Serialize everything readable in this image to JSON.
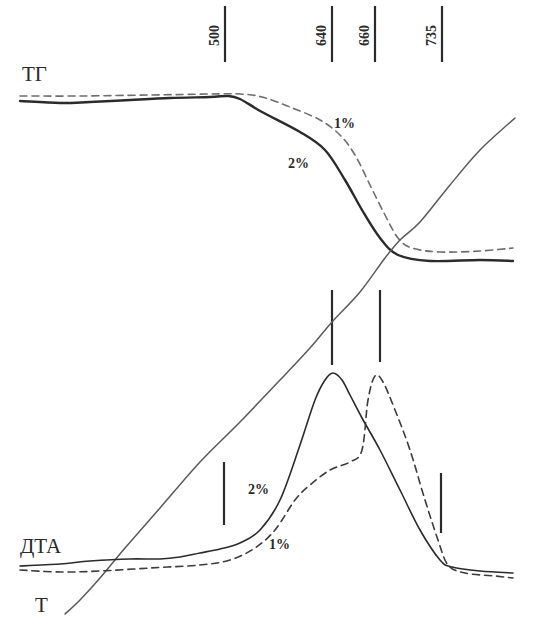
{
  "chart_data": {
    "type": "line",
    "title": "",
    "xlabel": "",
    "ylabel": "",
    "grid": false,
    "legend": "inline annotations",
    "curve_labels": {
      "tg": "ТГ",
      "dta": "ДТА",
      "t": "Т"
    },
    "temperature_markers": [
      {
        "label": "500",
        "x": 225
      },
      {
        "label": "640",
        "x": 332
      },
      {
        "label": "660",
        "x": 375
      },
      {
        "label": "735",
        "x": 442
      }
    ],
    "series": [
      {
        "name": "ТГ 2%",
        "group": "TG",
        "style": "solid",
        "color": "#2b2b2b",
        "width": 2.4,
        "points": [
          [
            20,
            101
          ],
          [
            60,
            103
          ],
          [
            90,
            102
          ],
          [
            130,
            100
          ],
          [
            170,
            98
          ],
          [
            210,
            97
          ],
          [
            228,
            96
          ],
          [
            240,
            99
          ],
          [
            262,
            112
          ],
          [
            300,
            132
          ],
          [
            325,
            150
          ],
          [
            345,
            180
          ],
          [
            362,
            210
          ],
          [
            380,
            238
          ],
          [
            398,
            255
          ],
          [
            430,
            261
          ],
          [
            480,
            260
          ],
          [
            513,
            261
          ]
        ]
      },
      {
        "name": "ТГ 1%",
        "group": "TG",
        "style": "dashed",
        "color": "#6e6e6e",
        "width": 1.6,
        "points": [
          [
            20,
            96
          ],
          [
            80,
            96
          ],
          [
            150,
            95
          ],
          [
            210,
            94
          ],
          [
            240,
            94
          ],
          [
            262,
            97
          ],
          [
            290,
            107
          ],
          [
            320,
            120
          ],
          [
            340,
            135
          ],
          [
            355,
            155
          ],
          [
            370,
            185
          ],
          [
            385,
            215
          ],
          [
            398,
            238
          ],
          [
            412,
            248
          ],
          [
            440,
            252
          ],
          [
            480,
            251
          ],
          [
            513,
            248
          ]
        ]
      },
      {
        "name": "Т",
        "group": "T",
        "style": "solid",
        "color": "#5a5a5a",
        "width": 1.5,
        "points": [
          [
            65,
            614
          ],
          [
            80,
            600
          ],
          [
            100,
            578
          ],
          [
            125,
            548
          ],
          [
            160,
            508
          ],
          [
            200,
            462
          ],
          [
            240,
            422
          ],
          [
            280,
            380
          ],
          [
            310,
            348
          ],
          [
            332,
            322
          ],
          [
            360,
            292
          ],
          [
            385,
            258
          ],
          [
            400,
            240
          ],
          [
            420,
            222
          ],
          [
            450,
            185
          ],
          [
            480,
            150
          ],
          [
            515,
            118
          ]
        ]
      },
      {
        "name": "ДТА 2%",
        "group": "DTA",
        "style": "solid",
        "color": "#2b2b2b",
        "width": 1.6,
        "points": [
          [
            20,
            566
          ],
          [
            60,
            564
          ],
          [
            90,
            561
          ],
          [
            130,
            559
          ],
          [
            160,
            559
          ],
          [
            180,
            557
          ],
          [
            200,
            553
          ],
          [
            220,
            549
          ],
          [
            240,
            543
          ],
          [
            260,
            530
          ],
          [
            280,
            500
          ],
          [
            300,
            445
          ],
          [
            315,
            400
          ],
          [
            325,
            380
          ],
          [
            333,
            373
          ],
          [
            342,
            380
          ],
          [
            350,
            395
          ],
          [
            362,
            418
          ],
          [
            380,
            450
          ],
          [
            400,
            490
          ],
          [
            420,
            530
          ],
          [
            440,
            560
          ],
          [
            452,
            567
          ],
          [
            480,
            571
          ],
          [
            513,
            573
          ]
        ]
      },
      {
        "name": "ДТА 1%",
        "group": "DTA",
        "style": "dashed",
        "color": "#3c3c3c",
        "width": 1.6,
        "points": [
          [
            20,
            570
          ],
          [
            60,
            572
          ],
          [
            100,
            571
          ],
          [
            150,
            568
          ],
          [
            200,
            565
          ],
          [
            230,
            560
          ],
          [
            255,
            548
          ],
          [
            275,
            530
          ],
          [
            295,
            500
          ],
          [
            310,
            485
          ],
          [
            330,
            470
          ],
          [
            350,
            462
          ],
          [
            362,
            450
          ],
          [
            368,
            400
          ],
          [
            375,
            376
          ],
          [
            383,
            382
          ],
          [
            395,
            410
          ],
          [
            410,
            450
          ],
          [
            425,
            500
          ],
          [
            438,
            540
          ],
          [
            448,
            565
          ],
          [
            465,
            573
          ],
          [
            495,
            576
          ],
          [
            513,
            578
          ]
        ]
      }
    ],
    "annotations": [
      {
        "text": "1%",
        "x": 334,
        "y": 128,
        "series": "ТГ 1%"
      },
      {
        "text": "2%",
        "x": 288,
        "y": 168,
        "series": "ТГ 2%"
      },
      {
        "text": "2%",
        "x": 248,
        "y": 494,
        "series": "ДТА 2%"
      },
      {
        "text": "1%",
        "x": 269,
        "y": 549,
        "series": "ДТА 1%"
      }
    ],
    "vertical_markers_lower": [
      {
        "x": 332,
        "y1": 290,
        "y2": 365
      },
      {
        "x": 380,
        "y1": 290,
        "y2": 362
      },
      {
        "x": 224,
        "y1": 462,
        "y2": 525
      },
      {
        "x": 441,
        "y1": 473,
        "y2": 533
      }
    ]
  }
}
